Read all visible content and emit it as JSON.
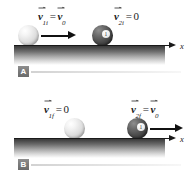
{
  "figure": {
    "type": "physics-collision-diagram",
    "background_color": "#ffffff",
    "axis_label": "x"
  },
  "panels": [
    {
      "id": "A",
      "badge_label": "A",
      "description": "before collision",
      "axis_label": "x",
      "balls": [
        {
          "name": "cue-ball",
          "color": "white",
          "number": "",
          "moving": true,
          "velocity_label": {
            "symbol": "v",
            "subscript": "1i",
            "equals": "=",
            "value_symbol": "v",
            "value_subscript": "0",
            "value_is_vector": true,
            "text": "v1i = v0"
          }
        },
        {
          "name": "target-ball",
          "color": "dark",
          "number": "1",
          "moving": false,
          "velocity_label": {
            "symbol": "v",
            "subscript": "2i",
            "equals": "=",
            "value_symbol": "0",
            "value_subscript": "",
            "value_is_vector": false,
            "text": "v2i = 0"
          }
        }
      ]
    },
    {
      "id": "B",
      "badge_label": "B",
      "description": "after collision",
      "axis_label": "x",
      "balls": [
        {
          "name": "cue-ball",
          "color": "white",
          "number": "",
          "moving": false,
          "velocity_label": {
            "symbol": "v",
            "subscript": "1f",
            "equals": "=",
            "value_symbol": "0",
            "value_subscript": "",
            "value_is_vector": false,
            "text": "v1f = 0"
          }
        },
        {
          "name": "target-ball",
          "color": "dark",
          "number": "1",
          "moving": true,
          "velocity_label": {
            "symbol": "v",
            "subscript": "2f",
            "equals": "=",
            "value_symbol": "v",
            "value_subscript": "0",
            "value_is_vector": true,
            "text": "v2f = v0"
          }
        }
      ]
    }
  ]
}
